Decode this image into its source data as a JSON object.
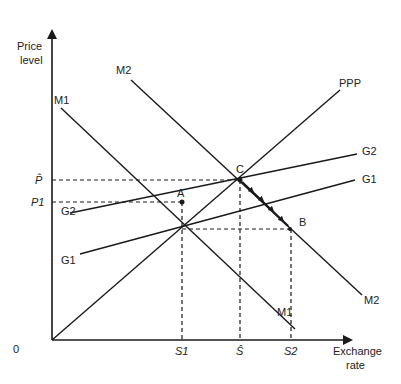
{
  "diagram": {
    "axes": {
      "y_label_line1": "Price",
      "y_label_line2": "level",
      "x_label_line1": "Exchange",
      "x_label_line2": "rate",
      "origin": "0"
    },
    "price_ticks": {
      "p_hat": "P̂",
      "p1": "P1"
    },
    "rate_ticks": {
      "s1": "S1",
      "s_hat": "Ŝ",
      "s2": "S2"
    },
    "curves": {
      "ppp": "PPP",
      "m1_top": "M1",
      "m1_bottom": "M1",
      "m2_top": "M2",
      "m2_bottom": "M2",
      "g1_left": "G1",
      "g1_right": "G1",
      "g2_left": "G2",
      "g2_right": "G2"
    },
    "points": {
      "a": "A",
      "b": "B",
      "c": "C"
    },
    "colors": {
      "ink": "#1a1a1a",
      "background": "#ffffff"
    }
  }
}
